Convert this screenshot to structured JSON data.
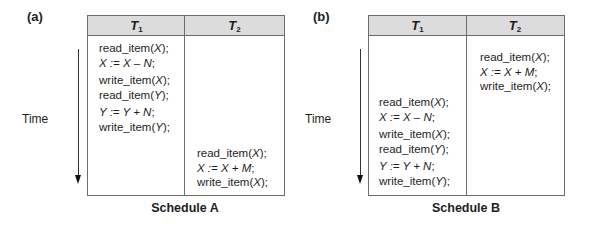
{
  "panels": [
    {
      "label": "(a)",
      "caption": "Schedule A",
      "time_label": "Time",
      "headers": [
        {
          "name": "T",
          "sub": "1"
        },
        {
          "name": "T",
          "sub": "2"
        }
      ],
      "t1_ops": [
        [
          "read_item(",
          "X",
          ");"
        ],
        [
          "",
          "X := X – N",
          ";"
        ],
        [
          "write_item(",
          "X",
          ");"
        ],
        [
          "read_item(",
          "Y",
          ");"
        ],
        [
          "",
          "Y := Y + N",
          ";"
        ],
        [
          "write_item(",
          "Y",
          ");"
        ]
      ],
      "t2_ops": [
        [
          "read_item(",
          "X",
          ");"
        ],
        [
          "",
          "X := X + M",
          ";"
        ],
        [
          "write_item(",
          "X",
          ");"
        ]
      ]
    },
    {
      "label": "(b)",
      "caption": "Schedule B",
      "time_label": "Time",
      "headers": [
        {
          "name": "T",
          "sub": "1"
        },
        {
          "name": "T",
          "sub": "2"
        }
      ],
      "t1_ops": [
        [
          "read_item(",
          "X",
          ");"
        ],
        [
          "",
          "X := X – N",
          ";"
        ],
        [
          "write_item(",
          "X",
          ");"
        ],
        [
          "read_item(",
          "Y",
          ");"
        ],
        [
          "",
          "Y := Y + N",
          ";"
        ],
        [
          "write_item(",
          "Y",
          ");"
        ]
      ],
      "t2_ops": [
        [
          "read_item(",
          "X",
          ");"
        ],
        [
          "",
          "X := X + M",
          ";"
        ],
        [
          "write_item(",
          "X",
          ");"
        ]
      ]
    }
  ]
}
